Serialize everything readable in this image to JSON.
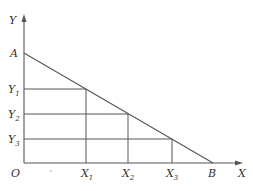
{
  "diagram": {
    "type": "linear-function-graph",
    "axes": {
      "x_label": "X",
      "y_label": "Y",
      "origin_label": "O"
    },
    "line": {
      "from_label": "A",
      "to_label": "B",
      "description": "straight line from A on Y-axis to B on X-axis"
    },
    "y_points": [
      {
        "label": "Y",
        "sub": "1"
      },
      {
        "label": "Y",
        "sub": "2"
      },
      {
        "label": "Y",
        "sub": "3"
      }
    ],
    "x_points": [
      {
        "label": "X",
        "sub": "1"
      },
      {
        "label": "X",
        "sub": "2"
      },
      {
        "label": "X",
        "sub": "3"
      }
    ],
    "colors": {
      "stroke": "#555555",
      "text": "#333333",
      "background": "#ffffff"
    }
  }
}
